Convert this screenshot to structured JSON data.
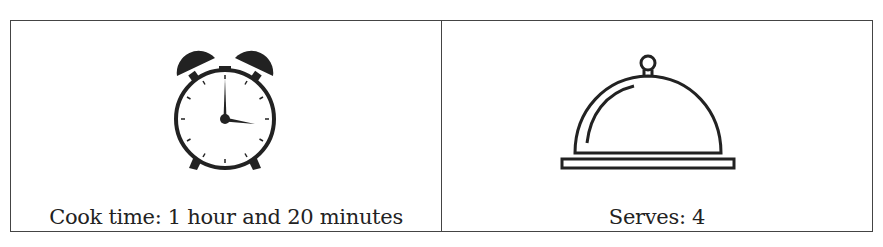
{
  "table": {
    "cells": [
      {
        "icon": "alarm-clock-icon",
        "caption": "Cook time: 1 hour and 20 minutes"
      },
      {
        "icon": "serving-cloche-icon",
        "caption": "Serves: 4"
      }
    ]
  },
  "colors": {
    "ink": "#222222",
    "border": "#444444"
  }
}
